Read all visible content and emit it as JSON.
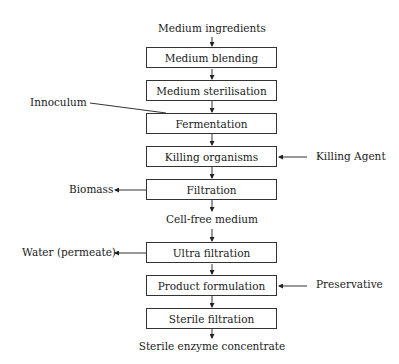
{
  "diagram": {
    "type": "process-flowchart",
    "input": "Medium ingredients",
    "steps": [
      {
        "id": "s1",
        "label": "Medium blending"
      },
      {
        "id": "s2",
        "label": "Medium sterilisation"
      },
      {
        "id": "s3",
        "label": "Fermentation"
      },
      {
        "id": "s4",
        "label": "Killing organisms"
      },
      {
        "id": "s5",
        "label": "Filtration"
      },
      {
        "id": "s6",
        "label": "Ultra filtration"
      },
      {
        "id": "s7",
        "label": "Product formulation"
      },
      {
        "id": "s8",
        "label": "Sterile filtration"
      }
    ],
    "intermediate": "Cell-free medium",
    "output": "Sterile enzyme concentrate",
    "side_inputs": [
      {
        "label": "Innoculum",
        "to": "Fermentation"
      },
      {
        "label": "Killing Agent",
        "to": "Killing organisms"
      },
      {
        "label": "Preservative",
        "to": "Product formulation"
      }
    ],
    "side_outputs": [
      {
        "label": "Biomass",
        "from": "Filtration"
      },
      {
        "label": "Water (permeate)",
        "from": "Ultra filtration"
      }
    ]
  }
}
